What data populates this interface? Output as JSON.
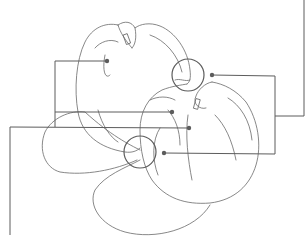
{
  "figure": {
    "type": "patent-style line drawing",
    "stroke_color": "#6a6a6a",
    "leader_color": "#5c5c5c",
    "background": "#ffffff",
    "detail_circles": 2,
    "leader_lines": 5
  }
}
